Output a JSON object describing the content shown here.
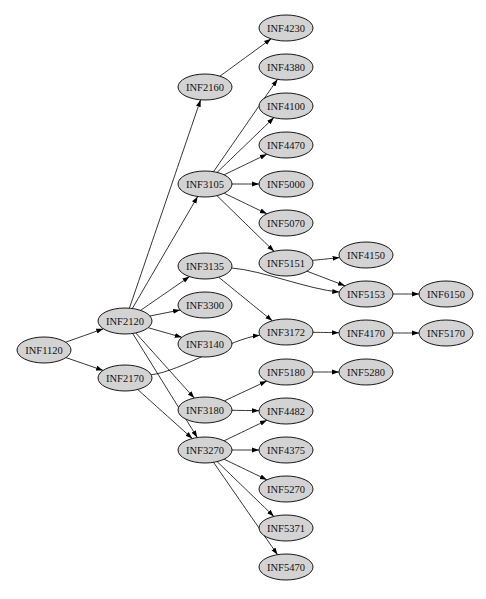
{
  "diagram": {
    "type": "directed-graph",
    "layout": "left-to-right",
    "node_style": {
      "shape": "ellipse",
      "fill": "#d3d3d3",
      "stroke": "#000000",
      "rx": 27,
      "ry": 13
    },
    "nodes": [
      {
        "id": "INF1120",
        "label": "INF1120",
        "x": 44,
        "y": 350
      },
      {
        "id": "INF2120",
        "label": "INF2120",
        "x": 125,
        "y": 321
      },
      {
        "id": "INF2170",
        "label": "INF2170",
        "x": 125,
        "y": 378
      },
      {
        "id": "INF2160",
        "label": "INF2160",
        "x": 205,
        "y": 87
      },
      {
        "id": "INF3105",
        "label": "INF3105",
        "x": 205,
        "y": 184
      },
      {
        "id": "INF3135",
        "label": "INF3135",
        "x": 205,
        "y": 266
      },
      {
        "id": "INF3300",
        "label": "INF3300",
        "x": 205,
        "y": 305
      },
      {
        "id": "INF3140",
        "label": "INF3140",
        "x": 205,
        "y": 344
      },
      {
        "id": "INF3180",
        "label": "INF3180",
        "x": 205,
        "y": 410
      },
      {
        "id": "INF3270",
        "label": "INF3270",
        "x": 205,
        "y": 450
      },
      {
        "id": "INF4230",
        "label": "INF4230",
        "x": 286,
        "y": 28
      },
      {
        "id": "INF4380",
        "label": "INF4380",
        "x": 286,
        "y": 67
      },
      {
        "id": "INF4100",
        "label": "INF4100",
        "x": 286,
        "y": 106
      },
      {
        "id": "INF4470",
        "label": "INF4470",
        "x": 286,
        "y": 145
      },
      {
        "id": "INF5000",
        "label": "INF5000",
        "x": 286,
        "y": 184
      },
      {
        "id": "INF5070",
        "label": "INF5070",
        "x": 286,
        "y": 223
      },
      {
        "id": "INF5151",
        "label": "INF5151",
        "x": 286,
        "y": 263
      },
      {
        "id": "INF3172",
        "label": "INF3172",
        "x": 286,
        "y": 332
      },
      {
        "id": "INF5180",
        "label": "INF5180",
        "x": 286,
        "y": 372
      },
      {
        "id": "INF4482",
        "label": "INF4482",
        "x": 286,
        "y": 411
      },
      {
        "id": "INF4375",
        "label": "INF4375",
        "x": 286,
        "y": 450
      },
      {
        "id": "INF5270",
        "label": "INF5270",
        "x": 286,
        "y": 489
      },
      {
        "id": "INF5371",
        "label": "INF5371",
        "x": 286,
        "y": 528
      },
      {
        "id": "INF5470",
        "label": "INF5470",
        "x": 286,
        "y": 567
      },
      {
        "id": "INF4150",
        "label": "INF4150",
        "x": 366,
        "y": 255
      },
      {
        "id": "INF5153",
        "label": "INF5153",
        "x": 366,
        "y": 294
      },
      {
        "id": "INF4170",
        "label": "INF4170",
        "x": 366,
        "y": 333
      },
      {
        "id": "INF5280",
        "label": "INF5280",
        "x": 366,
        "y": 372
      },
      {
        "id": "INF6150",
        "label": "INF6150",
        "x": 446,
        "y": 294
      },
      {
        "id": "INF5170",
        "label": "INF5170",
        "x": 446,
        "y": 333
      }
    ],
    "edges": [
      {
        "from": "INF1120",
        "to": "INF2120"
      },
      {
        "from": "INF1120",
        "to": "INF2170"
      },
      {
        "from": "INF2120",
        "to": "INF2160"
      },
      {
        "from": "INF2120",
        "to": "INF3105"
      },
      {
        "from": "INF2120",
        "to": "INF3135"
      },
      {
        "from": "INF2120",
        "to": "INF3300"
      },
      {
        "from": "INF2120",
        "to": "INF3140"
      },
      {
        "from": "INF2120",
        "to": "INF3180"
      },
      {
        "from": "INF2120",
        "to": "INF3270"
      },
      {
        "from": "INF2170",
        "to": "INF3172"
      },
      {
        "from": "INF2170",
        "to": "INF3270"
      },
      {
        "from": "INF2160",
        "to": "INF4230"
      },
      {
        "from": "INF3105",
        "to": "INF4380"
      },
      {
        "from": "INF3105",
        "to": "INF4100"
      },
      {
        "from": "INF3105",
        "to": "INF4470"
      },
      {
        "from": "INF3105",
        "to": "INF5000"
      },
      {
        "from": "INF3105",
        "to": "INF5070"
      },
      {
        "from": "INF3105",
        "to": "INF5151"
      },
      {
        "from": "INF3135",
        "to": "INF5153"
      },
      {
        "from": "INF3135",
        "to": "INF3172"
      },
      {
        "from": "INF5151",
        "to": "INF4150"
      },
      {
        "from": "INF5151",
        "to": "INF5153"
      },
      {
        "from": "INF5153",
        "to": "INF6150"
      },
      {
        "from": "INF3172",
        "to": "INF4170"
      },
      {
        "from": "INF4170",
        "to": "INF5170"
      },
      {
        "from": "INF3180",
        "to": "INF5180"
      },
      {
        "from": "INF3180",
        "to": "INF4482"
      },
      {
        "from": "INF5180",
        "to": "INF5280"
      },
      {
        "from": "INF3270",
        "to": "INF4482"
      },
      {
        "from": "INF3270",
        "to": "INF4375"
      },
      {
        "from": "INF3270",
        "to": "INF5270"
      },
      {
        "from": "INF3270",
        "to": "INF5371"
      },
      {
        "from": "INF3270",
        "to": "INF5470"
      }
    ]
  }
}
